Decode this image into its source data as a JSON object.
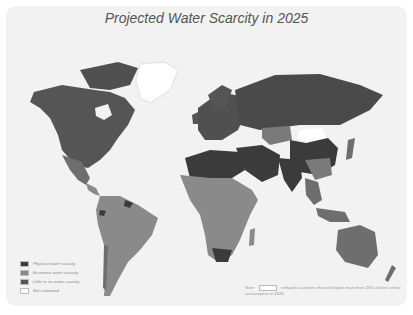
{
  "title": "Projected Water Scarcity in 2025",
  "colors": {
    "physical": "#3b3b3b",
    "economic": "#8a8a8a",
    "little": "#555555",
    "not_estimated": "#ffffff",
    "background": "#f2f2f2"
  },
  "legend": {
    "items": [
      {
        "label": "Physical water scarcity",
        "color": "#3b3b3b"
      },
      {
        "label": "Economic water scarcity",
        "color": "#8a8a8a"
      },
      {
        "label": "Little or no water scarcity",
        "color": "#555555"
      },
      {
        "label": "Not estimated",
        "color": "#ffffff"
      }
    ]
  },
  "note": {
    "prefix": "Note:",
    "text": "indicates countries that will import more than 10% of their cereal consumption in 2025."
  }
}
